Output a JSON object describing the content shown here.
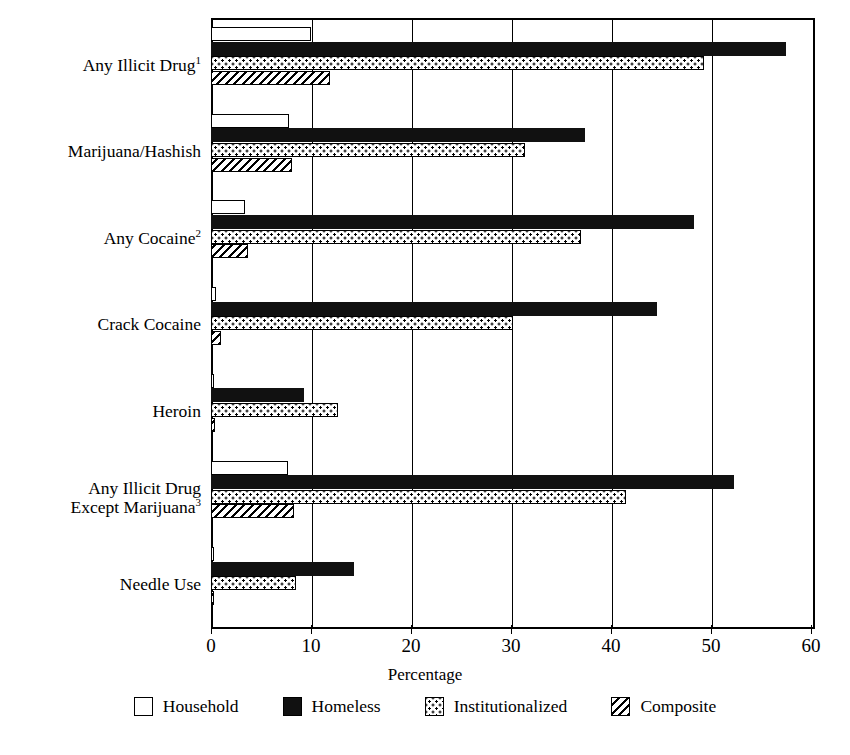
{
  "chart_data": {
    "type": "bar",
    "orientation": "horizontal",
    "title": "",
    "xlabel": "Percentage",
    "ylabel": "",
    "xlim": [
      0,
      60
    ],
    "xticks": [
      0,
      10,
      20,
      30,
      40,
      50,
      60
    ],
    "xtick_labels": [
      "0",
      "10",
      "20",
      "30",
      "40",
      "50",
      "60"
    ],
    "grid": true,
    "legend_position": "bottom",
    "categories": [
      "Any Illicit Drug",
      "Marijuana/Hashish",
      "Any Cocaine",
      "Crack Cocaine",
      "Heroin",
      "Any Illicit Drug Except Marijuana",
      "Needle Use"
    ],
    "category_labels": [
      {
        "line1": "Any Illicit Drug",
        "sup": "1",
        "line2": ""
      },
      {
        "line1": "Marijuana/Hashish",
        "sup": "",
        "line2": ""
      },
      {
        "line1": "Any Cocaine",
        "sup": "2",
        "line2": ""
      },
      {
        "line1": "Crack Cocaine",
        "sup": "",
        "line2": ""
      },
      {
        "line1": "Heroin",
        "sup": "",
        "line2": ""
      },
      {
        "line1": "Any Illicit Drug",
        "sup": "3",
        "line2": "Except Marijuana"
      },
      {
        "line1": "Needle Use",
        "sup": "",
        "line2": ""
      }
    ],
    "series": [
      {
        "name": "Household",
        "values": [
          10.0,
          7.8,
          3.4,
          0.5,
          0.3,
          7.7,
          0.2
        ]
      },
      {
        "name": "Homeless",
        "values": [
          57.5,
          37.4,
          48.3,
          44.6,
          9.3,
          52.3,
          14.3
        ]
      },
      {
        "name": "Institutionalized",
        "values": [
          49.3,
          31.4,
          37.0,
          30.2,
          12.7,
          41.5,
          8.5
        ]
      },
      {
        "name": "Composite",
        "values": [
          11.9,
          8.1,
          3.7,
          1.0,
          0.4,
          8.3,
          0.3
        ]
      }
    ]
  },
  "legend": {
    "items": [
      {
        "label": "Household",
        "key": "household"
      },
      {
        "label": "Homeless",
        "key": "homeless"
      },
      {
        "label": "Institutionalized",
        "key": "institutionalized"
      },
      {
        "label": "Composite",
        "key": "composite"
      }
    ]
  }
}
